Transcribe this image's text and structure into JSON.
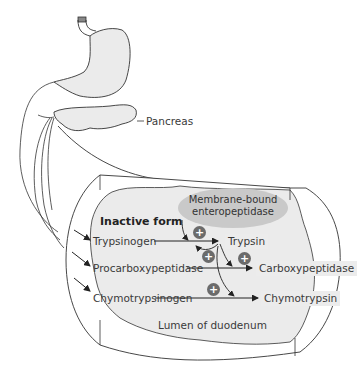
{
  "diagram": {
    "labels": {
      "pancreas": "Pancreas",
      "inactive_form": "Inactive form",
      "enteropeptidase": "Membrane-bound enteropeptidase",
      "enteropeptidase_line1": "Membrane-bound",
      "enteropeptidase_line2": "enteropeptidase",
      "lumen": "Lumen of duodenum"
    },
    "inactive": [
      "Trypsinogen",
      "Procarboxypeptidase",
      "Chymotrypsinogen"
    ],
    "active": [
      "Trypsin",
      "Carboxypeptidase",
      "Chymotrypsin"
    ],
    "activation_symbol": "+",
    "activations": [
      {
        "from": "Membrane-bound enteropeptidase",
        "to": "Trypsinogen → Trypsin"
      },
      {
        "from": "Trypsin",
        "to": "Trypsinogen → Trypsin"
      },
      {
        "from": "Trypsin",
        "to": "Procarboxypeptidase → Carboxypeptidase"
      },
      {
        "from": "Trypsin",
        "to": "Chymotrypsinogen → Chymotrypsin"
      }
    ],
    "colors": {
      "line": "#333333",
      "organ_fill": "#ebebeb",
      "bubble": "#c9c9c9",
      "plus_circle": "#6b6b6b",
      "label_box": "#ececec"
    }
  }
}
